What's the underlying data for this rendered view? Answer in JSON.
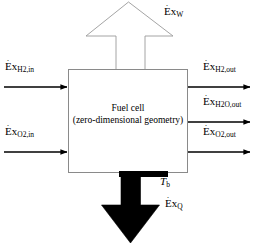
{
  "diagram": {
    "type": "block-flow-diagram",
    "colors": {
      "background": "#ffffff",
      "stroke": "#000000",
      "box_outline": "#808080",
      "hollow_arrow_outline": "#999999",
      "solid_arrow_fill": "#000000"
    },
    "control_volume": {
      "label_line1": "Fuel cell",
      "label_line2": "(zero-dimensional geometry)"
    },
    "flows": {
      "inputs": [
        {
          "id": "ex-h2-in",
          "symbol": "Ex",
          "dot": true,
          "subscript": "H2,in",
          "sub_parts": [
            "H",
            "2",
            ",in"
          ],
          "direction": "right",
          "side": "left",
          "style": "thin-solid"
        },
        {
          "id": "ex-o2-in",
          "symbol": "Ex",
          "dot": true,
          "subscript": "O2,in",
          "sub_parts": [
            "O",
            "2",
            ",in"
          ],
          "direction": "right",
          "side": "left",
          "style": "thin-solid"
        }
      ],
      "outputs": [
        {
          "id": "ex-h2-out",
          "symbol": "Ex",
          "dot": true,
          "subscript": "H2,out",
          "sub_parts": [
            "H",
            "2",
            ",out"
          ],
          "direction": "right",
          "side": "right",
          "style": "thin-solid"
        },
        {
          "id": "ex-h2o-out",
          "symbol": "Ex",
          "dot": true,
          "subscript": "H2O,out",
          "sub_parts": [
            "H",
            "2",
            "O,out"
          ],
          "direction": "right",
          "side": "right",
          "style": "thin-solid"
        },
        {
          "id": "ex-o2-out",
          "symbol": "Ex",
          "dot": true,
          "subscript": "O2,out",
          "sub_parts": [
            "O",
            "2",
            ",out"
          ],
          "direction": "right",
          "side": "right",
          "style": "thin-solid"
        }
      ],
      "work": {
        "id": "ex-w",
        "symbol": "Ex",
        "dot": true,
        "subscript": "W",
        "direction": "up",
        "side": "top",
        "style": "hollow-block-arrow"
      },
      "heat": {
        "id": "ex-q",
        "symbol": "Ex",
        "dot": true,
        "subscript": "Q",
        "direction": "down",
        "side": "bottom",
        "style": "solid-block-arrow"
      }
    },
    "boundary_temperature": {
      "symbol": "T",
      "subscript": "b",
      "italic": true
    }
  },
  "labels": {
    "ex_h2_in": "Ex",
    "ex_o2_in": "Ex",
    "ex_h2_out": "Ex",
    "ex_h2o_out": "Ex",
    "ex_o2_out": "Ex",
    "ex_w": "Ex",
    "ex_q": "Ex",
    "tb_symbol": "T",
    "tb_sub": "b",
    "sub_h2_in": "H",
    "sub_h2_in_num": "2",
    "sub_h2_in_tail": ",in",
    "sub_o2_in": "O",
    "sub_o2_in_num": "2",
    "sub_o2_in_tail": ",in",
    "sub_h2_out": "H",
    "sub_h2_out_num": "2",
    "sub_h2_out_tail": ",out",
    "sub_h2o_out": "H",
    "sub_h2o_out_num": "2",
    "sub_h2o_out_tail": "O,out",
    "sub_o2_out": "O",
    "sub_o2_out_num": "2",
    "sub_o2_out_tail": ",out",
    "sub_w": "W",
    "sub_q": "Q",
    "dot": "·",
    "box_line1": "Fuel cell",
    "box_line2": "(zero-dimensional geometry)"
  }
}
